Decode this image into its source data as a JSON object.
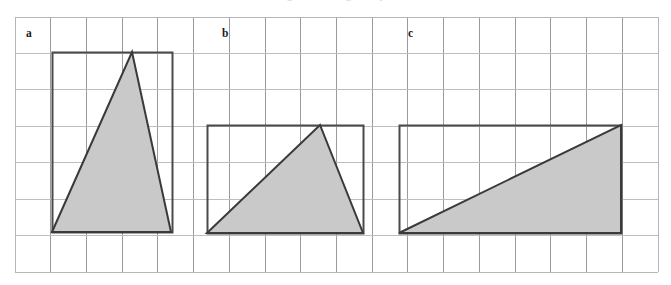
{
  "figure": {
    "top_caption_fragment": "a  triangle  and  rectangle  comparison",
    "canvas": {
      "width": 671,
      "height": 285,
      "background": "#ffffff"
    },
    "grid": {
      "x0": 15,
      "y0": 17,
      "x1": 658,
      "y1": 272,
      "columns": 18,
      "rows": 7,
      "cell_width": 35.7,
      "cell_height": 36.4,
      "vertical_line_color": "#9a9a9f",
      "horizontal_line_color": "#bdbdc2",
      "border_color": "#b5b5ba",
      "line_width": 1
    },
    "style": {
      "shape_fill": "#c9c9c9",
      "shape_stroke": "#3a3a3a",
      "rect_stroke": "#4a4a4a",
      "stroke_width": 2
    },
    "panels": [
      {
        "id": "panel-a",
        "label": "a",
        "label_x": 26,
        "label_y": 28,
        "rect": {
          "x": 52,
          "y": 52,
          "width": 120,
          "height": 180
        },
        "triangle_points": "52,232 132,52 171,232",
        "description": "triangle inscribed in a tall rectangle, apex near top middle",
        "base_cells": 3.3,
        "height_cells": 5.0
      },
      {
        "id": "panel-b",
        "label": "b",
        "label_x": 222,
        "label_y": 28,
        "rect": {
          "x": 207,
          "y": 125,
          "width": 156,
          "height": 108
        },
        "triangle_points": "207,233 320,125 363,233",
        "description": "triangle inscribed in a wide rectangle, apex right of centre",
        "base_cells": 4.4,
        "height_cells": 3.0
      },
      {
        "id": "panel-c",
        "label": "c",
        "label_x": 408,
        "label_y": 28,
        "rect": {
          "x": 399,
          "y": 125,
          "width": 222,
          "height": 108
        },
        "triangle_points": "399,233 621,125 621,233",
        "description": "right triangle inscribed in a wide rectangle, apex at top-right corner",
        "base_cells": 6.2,
        "height_cells": 3.0
      }
    ]
  }
}
